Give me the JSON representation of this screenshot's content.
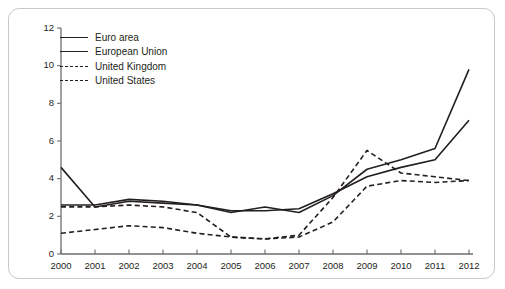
{
  "chart_data": {
    "type": "line",
    "title": "",
    "subtitle": "",
    "xlabel": "",
    "ylabel": "",
    "x": [
      2000,
      2001,
      2002,
      2003,
      2004,
      2005,
      2006,
      2007,
      2008,
      2009,
      2010,
      2011,
      2012
    ],
    "xtick_labels": [
      "2000",
      "2001",
      "2002",
      "2003",
      "2004",
      "2005",
      "2006",
      "2007",
      "2008",
      "2009",
      "2010",
      "2011",
      "2012"
    ],
    "ytick_labels": [
      "0",
      "2",
      "4",
      "6",
      "8",
      "10",
      "12"
    ],
    "yticks": [
      0,
      2,
      4,
      6,
      8,
      10,
      12
    ],
    "ylim": [
      0,
      12
    ],
    "xlim": [
      2000,
      2012
    ],
    "grid": false,
    "legend_position": "top-left",
    "series": [
      {
        "name": "Euro area",
        "style": "solid",
        "color": "#231f20",
        "values": [
          4.6,
          2.5,
          2.8,
          2.7,
          2.6,
          2.2,
          2.5,
          2.2,
          3.1,
          4.5,
          5.0,
          5.6,
          9.8
        ]
      },
      {
        "name": "European Union",
        "style": "solid",
        "color": "#231f20",
        "values": [
          2.6,
          2.6,
          2.9,
          2.8,
          2.6,
          2.3,
          2.3,
          2.4,
          3.2,
          4.1,
          4.6,
          5.0,
          7.1
        ]
      },
      {
        "name": "United Kingdom",
        "style": "dashed",
        "color": "#231f20",
        "values": [
          2.5,
          2.5,
          2.6,
          2.5,
          2.2,
          0.9,
          0.8,
          1.0,
          3.0,
          5.5,
          4.3,
          4.1,
          3.9
        ]
      },
      {
        "name": "United States",
        "style": "dashed",
        "color": "#231f20",
        "values": [
          1.1,
          1.3,
          1.5,
          1.4,
          1.1,
          0.9,
          0.8,
          0.9,
          1.7,
          3.6,
          3.9,
          3.8,
          3.9
        ]
      }
    ]
  },
  "legend": {
    "items": [
      {
        "label": "Euro area",
        "style": "solid"
      },
      {
        "label": "European Union",
        "style": "solid"
      },
      {
        "label": "United Kingdom",
        "style": "dashed"
      },
      {
        "label": "United States",
        "style": "dashed"
      }
    ]
  },
  "colors": {
    "ink": "#231f20",
    "axis": "#6d6e71",
    "frame": "#c8c8c8"
  }
}
